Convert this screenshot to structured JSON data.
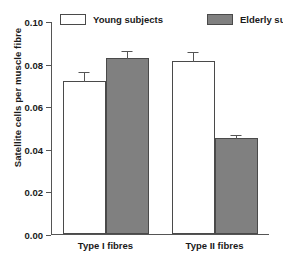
{
  "chart_data": {
    "type": "bar",
    "title": "",
    "xlabel": "",
    "ylabel": "Satellite cells per muscle fibre",
    "categories": [
      "Type I fibres",
      "Type II fibres"
    ],
    "ylim": [
      0.0,
      0.1
    ],
    "yticks": [
      "0.00",
      "0.02",
      "0.04",
      "0.06",
      "0.08",
      "0.10"
    ],
    "ytick_values": [
      0.0,
      0.02,
      0.04,
      0.06,
      0.08,
      0.1
    ],
    "grid": false,
    "legend_position": "top",
    "series": [
      {
        "name": "Young subjects",
        "fill": "#ffffff",
        "values": [
          0.072,
          0.081
        ],
        "errors": [
          0.0045,
          0.005
        ]
      },
      {
        "name": "Elderly subjects",
        "fill": "#808080",
        "values": [
          0.0825,
          0.045
        ],
        "errors": [
          0.004,
          0.002
        ]
      }
    ]
  },
  "colors": {
    "open_fill": "#ffffff",
    "filled_fill": "#808080",
    "outline": "#4a4a4a",
    "axis": "#555555",
    "text": "#1a1a1a"
  }
}
